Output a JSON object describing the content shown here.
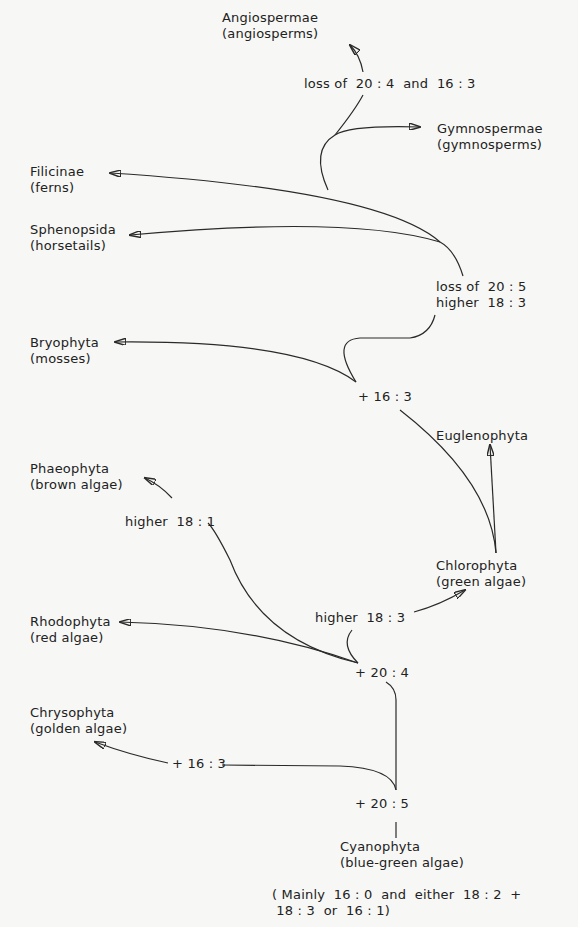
{
  "diagram": {
    "type": "evolutionary-tree",
    "taxa": [
      {
        "name": "Angiospermae",
        "common": "(angiosperms)"
      },
      {
        "name": "Gymnospermae",
        "common": "(gymnosperms)"
      },
      {
        "name": "Filicinae",
        "common": "(ferns)"
      },
      {
        "name": "Sphenopsida",
        "common": "(horsetails)"
      },
      {
        "name": "Bryophyta",
        "common": "(mosses)"
      },
      {
        "name": "Euglenophyta",
        "common": ""
      },
      {
        "name": "Phaeophyta",
        "common": "(brown algae)"
      },
      {
        "name": "Chlorophyta",
        "common": "(green algae)"
      },
      {
        "name": "Rhodophyta",
        "common": "(red algae)"
      },
      {
        "name": "Chrysophyta",
        "common": "(golden algae)"
      },
      {
        "name": "Cyanophyta",
        "common": "(blue-green algae)"
      }
    ],
    "changes": {
      "angio": "loss of  20 : 4  and  16 : 3",
      "tracheo_1": "loss of  20 : 5",
      "tracheo_2": "higher  18 : 3",
      "bryo": "+ 16 : 3",
      "phaeo": "higher  18 : 1",
      "chloro": "higher  18 : 3",
      "rhodo": "+ 20 : 4",
      "chryso": "+ 16 : 3",
      "cyano": "+ 20 : 5"
    },
    "footnote_1": "( Mainly  16 : 0  and  either  18 : 2  +",
    "footnote_2": " 18 : 3  or  16 : 1)"
  }
}
